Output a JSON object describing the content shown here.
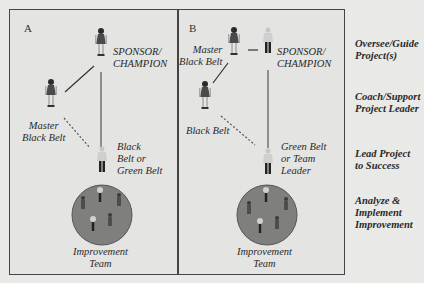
{
  "panels": [
    {
      "letter": "A",
      "sponsor": [
        "SPONSOR/",
        "CHAMPION"
      ],
      "master": [
        "Master",
        "Black Belt"
      ],
      "leader": [
        "Black",
        "Belt or",
        "Green Belt"
      ],
      "team": [
        "Improvement",
        "Team"
      ]
    },
    {
      "letter": "B",
      "sponsor": [
        "SPONSOR/",
        "CHAMPION"
      ],
      "master": [
        "Master",
        "Black Belt"
      ],
      "black_belt": "Black Belt",
      "leader": [
        "Green Belt",
        "or Team",
        "Leader"
      ],
      "team": [
        "Improvement",
        "Team"
      ]
    }
  ],
  "roles": [
    [
      "Oversee/Guide",
      "Project(s)"
    ],
    [
      "Coach/Support",
      "Project Leader"
    ],
    [
      "Lead Project",
      "to Success"
    ],
    [
      "Analyze &",
      "Implement",
      "Improvement"
    ]
  ],
  "colors": {
    "frame": "#444444",
    "background": "#e9e9e7",
    "team_circle": "#7f7f7d",
    "text": "#2a2a2a"
  }
}
